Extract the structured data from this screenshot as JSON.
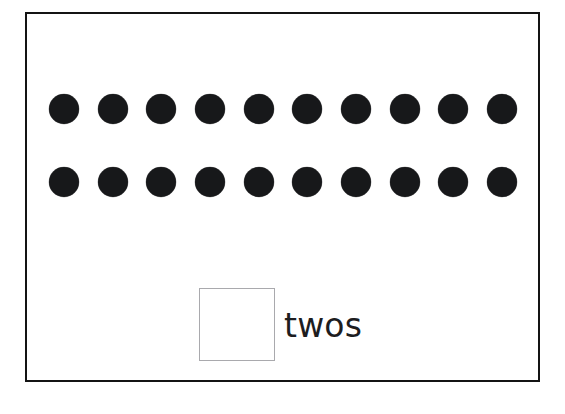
{
  "page": {
    "background_color": "#ffffff",
    "width": 565,
    "height": 414
  },
  "worksheet": {
    "frame": {
      "border_color": "#141414",
      "border_width": 2,
      "fill_color": "#ffffff"
    },
    "counters": {
      "shape": "filled-circle",
      "color": "#17181a",
      "diameter": 30,
      "total_count": 20,
      "rows": [
        {
          "row_index": 1,
          "count": 10,
          "center_y": 95,
          "x_centers": [
            37,
            86,
            134,
            183,
            232,
            280,
            329,
            378,
            426,
            475
          ]
        },
        {
          "row_index": 2,
          "count": 10,
          "center_y": 168,
          "x_centers": [
            37,
            86,
            134,
            183,
            232,
            280,
            329,
            378,
            426,
            475
          ]
        }
      ]
    },
    "answer": {
      "box": {
        "value": "",
        "placeholder": "",
        "border_color": "#a9a9ad",
        "fill_color": "#ffffff",
        "width": 76,
        "height": 73
      },
      "label": "twos",
      "label_color": "#1d1d1f",
      "label_font_size": 33
    }
  }
}
